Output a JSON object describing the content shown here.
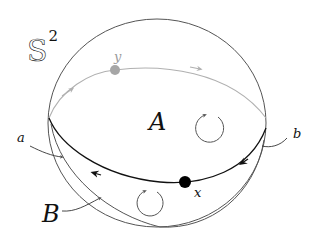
{
  "diagram": {
    "title": {
      "symbol": "S",
      "superscript": "2"
    },
    "regions": [
      {
        "id": "A",
        "label": "A"
      },
      {
        "id": "B",
        "label": "B"
      }
    ],
    "points": [
      {
        "id": "x",
        "label": "x",
        "color": "#000000"
      },
      {
        "id": "y",
        "label": "y",
        "color": "#a6a6a6"
      }
    ],
    "arcs": [
      {
        "id": "a",
        "label": "a"
      },
      {
        "id": "b",
        "label": "b"
      }
    ],
    "colors": {
      "outline": "#555555",
      "front_equator": "#111111",
      "back_equator": "#b0b0b0",
      "rotation_arrows": "#555555"
    }
  }
}
